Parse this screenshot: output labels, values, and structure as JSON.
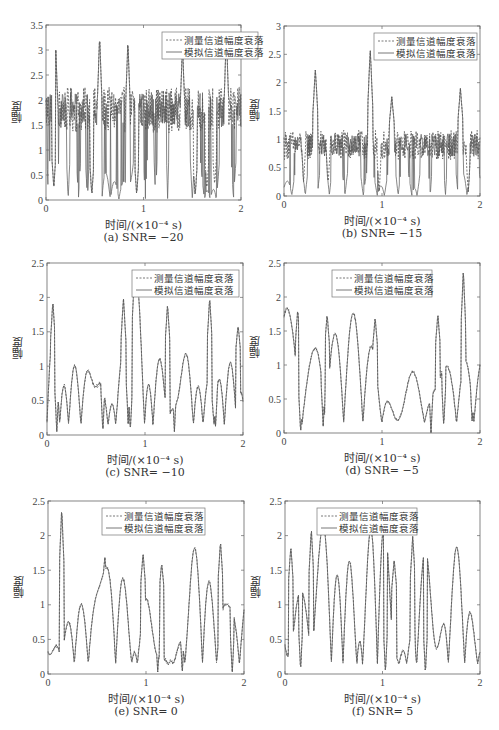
{
  "figure": {
    "ylabel": "幅度",
    "xlabel": "时间/(×10⁻⁴ s)",
    "legend": [
      "测量信道幅度衰落",
      "模拟信道幅度衰落"
    ],
    "series_colors": {
      "measured": "#555555",
      "simulated": "#6a6a6a"
    },
    "bottom_caption_partial": "图 … （截断）"
  },
  "chart_data": [
    {
      "type": "line",
      "caption": "(a) SNR= −20",
      "xlabel": "时间/(×10⁻⁴ s)",
      "ylabel": "幅度",
      "xlim": [
        0,
        2
      ],
      "ylim": [
        0,
        3.5
      ],
      "xticks": [
        0,
        1,
        2
      ],
      "yticks": [
        0,
        0.5,
        1,
        1.5,
        2,
        2.5,
        3,
        3.5
      ],
      "ytick_labels": [
        "0",
        "0.5",
        "1",
        "1.5",
        "2",
        "2.5",
        "3",
        "3.5"
      ],
      "legend": [
        "测量信道幅度衰落",
        "模拟信道幅度衰落"
      ],
      "legend_position": "upper right",
      "grid": false,
      "series": [
        {
          "name": "测量信道幅度衰落",
          "style": "dashed",
          "baseline": 1.8,
          "noise": 0.35,
          "peaks": [
            [
              0.1,
              3.0
            ],
            [
              0.55,
              3.3
            ],
            [
              0.84,
              3.2
            ],
            [
              1.4,
              3.1
            ],
            [
              1.85,
              3.35
            ]
          ]
        },
        {
          "name": "模拟信道幅度衰落",
          "style": "solid",
          "baseline": 1.8,
          "troughs": [
            [
              0.08,
              0.25
            ],
            [
              0.47,
              0.1
            ],
            [
              0.93,
              0.1
            ],
            [
              1.53,
              0.08
            ],
            [
              1.65,
              0.2
            ],
            [
              1.73,
              0.3
            ]
          ]
        }
      ]
    },
    {
      "type": "line",
      "caption": "(b) SNR= −15",
      "xlabel": "时间/(×10⁻⁴ s)",
      "ylabel": "幅度",
      "xlim": [
        0,
        2
      ],
      "ylim": [
        0,
        3
      ],
      "xticks": [
        0,
        1,
        2
      ],
      "yticks": [
        0,
        0.5,
        1,
        1.5,
        2,
        2.5,
        3
      ],
      "ytick_labels": [
        "0",
        "0.5",
        "1",
        "1.5",
        "2",
        "2.5",
        "3"
      ],
      "legend": [
        "测量信道幅度衰落",
        "模拟信道幅度衰落"
      ],
      "legend_position": "upper right",
      "grid": false,
      "series": [
        {
          "name": "测量信道幅度衰落",
          "style": "dashed",
          "baseline": 0.9,
          "noise": 0.2,
          "peaks": [
            [
              0.32,
              2.25
            ],
            [
              0.88,
              2.6
            ],
            [
              1.1,
              1.75
            ],
            [
              1.8,
              1.9
            ]
          ]
        },
        {
          "name": "模拟信道幅度衰落",
          "style": "solid",
          "baseline": 0.9,
          "troughs": [
            [
              0.2,
              0.25
            ],
            [
              0.45,
              0.2
            ],
            [
              0.97,
              0.05
            ],
            [
              1.88,
              0.05
            ]
          ]
        }
      ]
    },
    {
      "type": "line",
      "caption": "(c) SNR= −10",
      "xlabel": "时间/(×10⁻⁴ s)",
      "ylabel": "幅度",
      "xlim": [
        0,
        2
      ],
      "ylim": [
        0,
        2.5
      ],
      "xticks": [
        0,
        1,
        2
      ],
      "yticks": [
        0,
        0.5,
        1,
        1.5,
        2,
        2.5
      ],
      "ytick_labels": [
        "0",
        "0.5",
        "1",
        "1.5",
        "2",
        "2.5"
      ],
      "legend": [
        "测量信道幅度衰落",
        "模拟信道幅度衰落"
      ],
      "legend_position": "upper right",
      "grid": false,
      "series": [
        {
          "name": "测量信道幅度衰落",
          "style": "dashed",
          "peaks": [
            [
              0.06,
              1.95
            ],
            [
              0.78,
              2.0
            ],
            [
              1.23,
              1.9
            ],
            [
              1.66,
              2.0
            ],
            [
              1.95,
              1.6
            ]
          ]
        },
        {
          "name": "模拟信道幅度衰落",
          "style": "solid",
          "troughs": [
            [
              0.1,
              0.05
            ],
            [
              0.57,
              0.05
            ],
            [
              0.85,
              0.05
            ],
            [
              1.3,
              0.05
            ],
            [
              1.72,
              0.1
            ]
          ]
        }
      ]
    },
    {
      "type": "line",
      "caption": "(d) SNR= −5",
      "xlabel": "时间/(×10⁻⁴ s)",
      "ylabel": "幅度",
      "xlim": [
        0,
        2
      ],
      "ylim": [
        0,
        2.5
      ],
      "xticks": [
        0,
        1,
        2
      ],
      "yticks": [
        0,
        0.5,
        1,
        1.5,
        2,
        2.5
      ],
      "ytick_labels": [
        "0",
        "0.5",
        "1",
        "1.5",
        "2",
        "2.5"
      ],
      "legend": [
        "测量信道幅度衰落",
        "模拟信道幅度衰落"
      ],
      "legend_position": "upper center",
      "grid": false,
      "series": [
        {
          "name": "测量信道幅度衰落",
          "style": "dashed",
          "peaks": [
            [
              0.14,
              1.82
            ],
            [
              0.44,
              1.75
            ],
            [
              0.93,
              1.7
            ],
            [
              1.57,
              1.75
            ],
            [
              1.83,
              2.4
            ]
          ]
        },
        {
          "name": "模拟信道幅度衰落",
          "style": "solid",
          "troughs": [
            [
              0.17,
              0.0
            ],
            [
              0.4,
              0.1
            ],
            [
              1.5,
              0.0
            ],
            [
              1.63,
              0.1
            ],
            [
              1.92,
              0.15
            ]
          ]
        }
      ]
    },
    {
      "type": "line",
      "caption": "(e) SNR= 0",
      "xlabel": "时间/(×10⁻⁴ s)",
      "ylabel": "幅度",
      "xlim": [
        0,
        2
      ],
      "ylim": [
        0,
        2.5
      ],
      "xticks": [
        0,
        1,
        2
      ],
      "yticks": [
        0,
        0.5,
        1,
        1.5,
        2,
        2.5
      ],
      "ytick_labels": [
        "0",
        "0.5",
        "1",
        "1.5",
        "2",
        "2.5"
      ],
      "legend": [
        "测量信道幅度衰落",
        "模拟信道幅度衰落"
      ],
      "legend_position": "upper center",
      "grid": false,
      "series": [
        {
          "name": "测量信道幅度衰落",
          "style": "dashed",
          "peaks": [
            [
              0.14,
              2.4
            ],
            [
              0.58,
              1.7
            ],
            [
              0.97,
              1.75
            ],
            [
              1.16,
              1.6
            ],
            [
              1.76,
              1.92
            ]
          ]
        },
        {
          "name": "模拟信道幅度衰落",
          "style": "solid",
          "troughs": [
            [
              0.27,
              0.2
            ],
            [
              1.12,
              0.0
            ],
            [
              1.37,
              0.0
            ],
            [
              1.88,
              0.0
            ]
          ]
        }
      ]
    },
    {
      "type": "line",
      "caption": "(f) SNR= 5",
      "xlabel": "时间/(×10⁻⁴ s)",
      "ylabel": "幅度",
      "xlim": [
        0,
        2
      ],
      "ylim": [
        0,
        2.5
      ],
      "xticks": [
        0,
        1,
        2
      ],
      "yticks": [
        0,
        0.5,
        1,
        1.5,
        2,
        2.5
      ],
      "ytick_labels": [
        "0",
        "0.5",
        "1",
        "1.5",
        "2",
        "2.5"
      ],
      "legend": [
        "测量信道幅度衰落",
        "模拟信道幅度衰落"
      ],
      "legend_position": "upper left",
      "grid": false,
      "series": [
        {
          "name": "测量信道幅度衰落",
          "style": "dashed",
          "peaks": [
            [
              0.06,
              1.85
            ],
            [
              0.27,
              2.1
            ],
            [
              1.31,
              2.0
            ],
            [
              1.46,
              1.7
            ],
            [
              1.12,
              1.65
            ]
          ]
        },
        {
          "name": "模拟信道幅度衰落",
          "style": "solid",
          "troughs": [
            [
              0.16,
              0.05
            ],
            [
              1.03,
              0.02
            ],
            [
              1.44,
              0.0
            ],
            [
              1.35,
              0.1
            ]
          ]
        }
      ]
    }
  ],
  "layout": [
    {
      "left": 46,
      "top": 25,
      "width": 195,
      "height": 175,
      "legend": {
        "x": 116,
        "y": 7,
        "w": 96,
        "h": 27
      }
    },
    {
      "left": 284,
      "top": 26,
      "width": 196,
      "height": 170,
      "legend": {
        "x": 90,
        "y": 7,
        "w": 103,
        "h": 27
      }
    },
    {
      "left": 47,
      "top": 263,
      "width": 196,
      "height": 172,
      "legend": {
        "x": 85,
        "y": 7,
        "w": 107,
        "h": 27
      }
    },
    {
      "left": 284,
      "top": 263,
      "width": 196,
      "height": 170,
      "legend": {
        "x": 48,
        "y": 7,
        "w": 100,
        "h": 27
      }
    },
    {
      "left": 48,
      "top": 501,
      "width": 196,
      "height": 173,
      "legend": {
        "x": 54,
        "y": 7,
        "w": 103,
        "h": 27
      }
    },
    {
      "left": 285,
      "top": 501,
      "width": 195,
      "height": 173,
      "legend": {
        "x": 32,
        "y": 7,
        "w": 100,
        "h": 27
      }
    }
  ]
}
